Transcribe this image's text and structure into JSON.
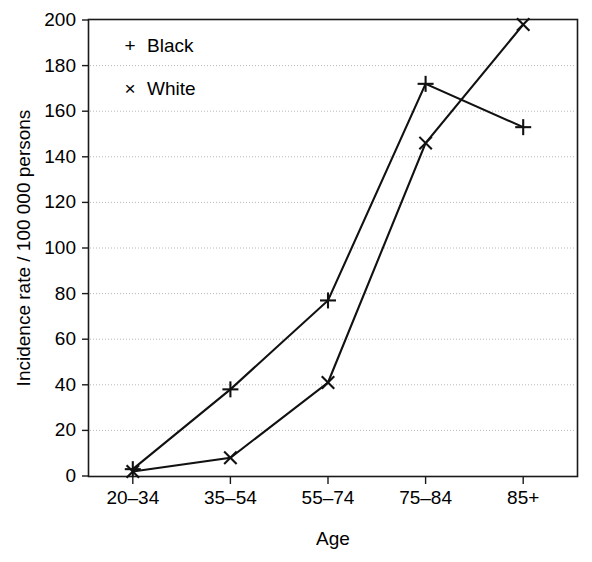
{
  "chart_data": {
    "type": "line",
    "title": "",
    "xlabel": "Age",
    "ylabel": "Incidence rate / 100 000 persons",
    "categories": [
      "20–34",
      "35–54",
      "55–74",
      "75–84",
      "85+"
    ],
    "series": [
      {
        "name": "Black",
        "marker": "plus",
        "marker_symbol": "+",
        "values": [
          3,
          38,
          77,
          172,
          153
        ]
      },
      {
        "name": "White",
        "marker": "cross",
        "marker_symbol": "×",
        "values": [
          2,
          8,
          41,
          146,
          198
        ]
      }
    ],
    "ylim": [
      0,
      200
    ],
    "yticks": [
      0,
      20,
      40,
      60,
      80,
      100,
      120,
      140,
      160,
      180,
      200
    ],
    "ytick_labels": [
      "0",
      "20",
      "40",
      "60",
      "80",
      "100",
      "120",
      "140",
      "160",
      "180",
      "200"
    ],
    "xtick_labels": [
      "20–34",
      "35–54",
      "55–74",
      "75–84",
      "85+"
    ],
    "grid": "horizontal-dotted",
    "legend_position": "top-left-inside",
    "legend": [
      {
        "marker": "+",
        "label": "Black"
      },
      {
        "marker": "×",
        "label": "White"
      }
    ],
    "colors": {
      "line": "#111111",
      "grid": "#b8b8b8",
      "frame": "#1a1a1a",
      "background": "#ffffff"
    }
  }
}
